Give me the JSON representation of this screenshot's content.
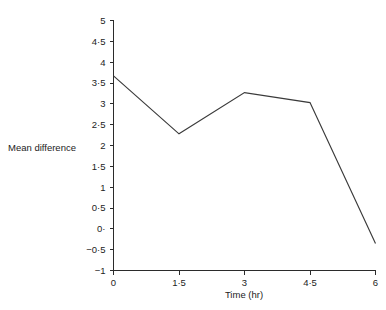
{
  "chart_data": {
    "type": "line",
    "title": "",
    "xlabel": "Time (hr)",
    "ylabel": "Mean difference",
    "x": [
      0,
      1.5,
      3,
      4.5,
      6
    ],
    "values": [
      3.67,
      2.28,
      3.27,
      3.03,
      -0.35
    ],
    "series": [
      {
        "name": "Mean difference",
        "values": [
          3.67,
          2.28,
          3.27,
          3.03,
          -0.35
        ]
      }
    ],
    "xlim": [
      0,
      6
    ],
    "ylim": [
      -1,
      5
    ],
    "grid": false,
    "legend": false,
    "xticks": [
      0,
      1.5,
      3,
      4.5,
      6
    ],
    "yticks": [
      -1,
      -0.5,
      0,
      0.5,
      1,
      1.5,
      2,
      2.5,
      3,
      3.5,
      4,
      4.5,
      5
    ],
    "xtick_labels": [
      "0",
      "1·5",
      "3",
      "4·5",
      "6"
    ],
    "ytick_labels": [
      "−1",
      "−0·5",
      "0·",
      "0·5",
      "1",
      "1·5",
      "2",
      "2·5",
      "3",
      "3·5",
      "4",
      "4·5",
      "5"
    ],
    "line_color": "#3a3a3a",
    "axis_color": "#2b2b2b",
    "background_color": "#ffffff"
  },
  "labels": {
    "y_axis_title": "Mean difference",
    "x_axis_title": "Time (hr)"
  }
}
